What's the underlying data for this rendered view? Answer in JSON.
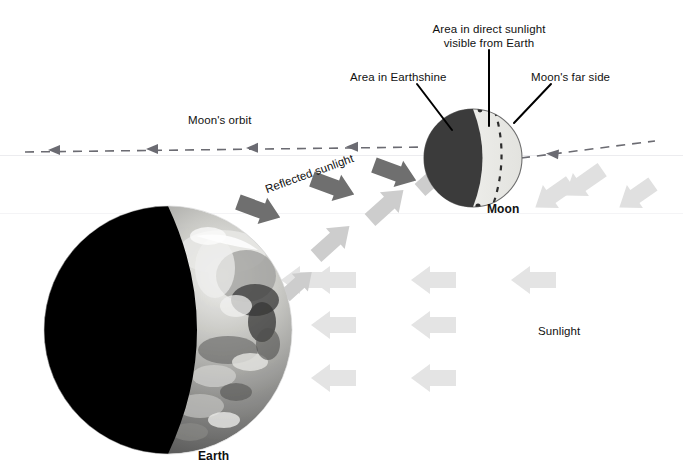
{
  "figure": {
    "background_color": "#ffffff"
  },
  "colors": {
    "sunlight_arrow": "#e2e2e2",
    "earthshine_arrow": "#c9c9c9",
    "reflected_arrow": "#6f6f6f",
    "moon_dark": "#3b3b3b",
    "moon_lit": "#efefec",
    "earth_dark": "#000000",
    "orbit_line": "#6b6b72",
    "leader_line": "#000000",
    "text": "#111111",
    "baseline": "#e9e9ec"
  },
  "labels": {
    "area_direct_sunlight": {
      "line1": "Area in direct sunlight",
      "line2": "visible from Earth"
    },
    "area_earthshine": "Area in Earthshine",
    "moons_far_side": "Moon's far side",
    "moons_orbit": "Moon's orbit",
    "reflected_sunlight": "Reflected sunlight",
    "sunlight": "Sunlight",
    "moon": "Moon",
    "earth": "Earth"
  },
  "bodies": {
    "moon": {
      "name": "Moon",
      "center_x": 473,
      "center_y": 158,
      "radius": 49,
      "dark_fraction": 0.6,
      "has_dashed_terminator": true
    },
    "earth": {
      "name": "Earth",
      "center_x": 168,
      "center_y": 330,
      "radius": 124,
      "dark_fraction": 0.66,
      "lit_side": "right"
    }
  },
  "orbit": {
    "label": "Moon's orbit",
    "style": "dashed",
    "direction": "leftward",
    "arrowhead_count": 4
  },
  "arrow_groups": [
    {
      "name": "sunlight",
      "label": "Sunlight",
      "color": "#e2e2e2",
      "direction": "left",
      "count": 8,
      "description": "Parallel light gray arrows travelling right to left representing incoming sunlight"
    },
    {
      "name": "earthshine",
      "label": "Earthshine",
      "color": "#c9c9c9",
      "direction": "up-right",
      "count": 4,
      "description": "Light gray arrows from Earth toward the Moon"
    },
    {
      "name": "reflected-sunlight",
      "label": "Reflected sunlight",
      "color": "#6f6f6f",
      "direction": "down-left",
      "count": 3,
      "description": "Dark gray arrows from Moon toward Earth"
    }
  ]
}
